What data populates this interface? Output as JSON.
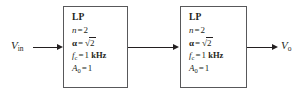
{
  "diagram": {
    "input_port": {
      "symbol": "V",
      "subscript": "in",
      "full": "V_in"
    },
    "output_port": {
      "symbol": "V",
      "subscript": "o",
      "full": "V_o"
    },
    "blocks": [
      {
        "id": "stage-1",
        "title": "LP",
        "specs": [
          {
            "symbol": "n",
            "style": "italic",
            "equals": "=",
            "value": "2",
            "unit": ""
          },
          {
            "symbol": "α",
            "style": "bold",
            "equals": "=",
            "value": "2",
            "value_kind": "sqrt",
            "unit": ""
          },
          {
            "symbol": "f",
            "subscript": "c",
            "style": "italic",
            "equals": "=",
            "value": "1",
            "unit": "kHz"
          },
          {
            "symbol": "A",
            "subscript": "0",
            "style": "italic",
            "equals": "=",
            "value": "1",
            "unit": ""
          }
        ]
      },
      {
        "id": "stage-2",
        "title": "LP",
        "specs": [
          {
            "symbol": "n",
            "style": "italic",
            "equals": "=",
            "value": "2",
            "unit": ""
          },
          {
            "symbol": "α",
            "style": "bold",
            "equals": "=",
            "value": "2",
            "value_kind": "sqrt",
            "unit": ""
          },
          {
            "symbol": "f",
            "subscript": "c",
            "style": "italic",
            "equals": "=",
            "value": "1",
            "unit": "kHz"
          },
          {
            "symbol": "A",
            "subscript": "0",
            "style": "italic",
            "equals": "=",
            "value": "1",
            "unit": ""
          }
        ]
      }
    ],
    "connectors": [
      {
        "id": "input-arrow",
        "from": "V_in",
        "to": "stage-1",
        "direction": "right"
      },
      {
        "id": "interstage-arrow",
        "from": "stage-1",
        "to": "stage-2",
        "direction": "right"
      },
      {
        "id": "output-arrow",
        "from": "stage-2",
        "to": "V_o",
        "direction": "right"
      }
    ],
    "colors": {
      "stroke": "#231f20",
      "box_border": "#58585a",
      "background": "#ffffff"
    }
  }
}
